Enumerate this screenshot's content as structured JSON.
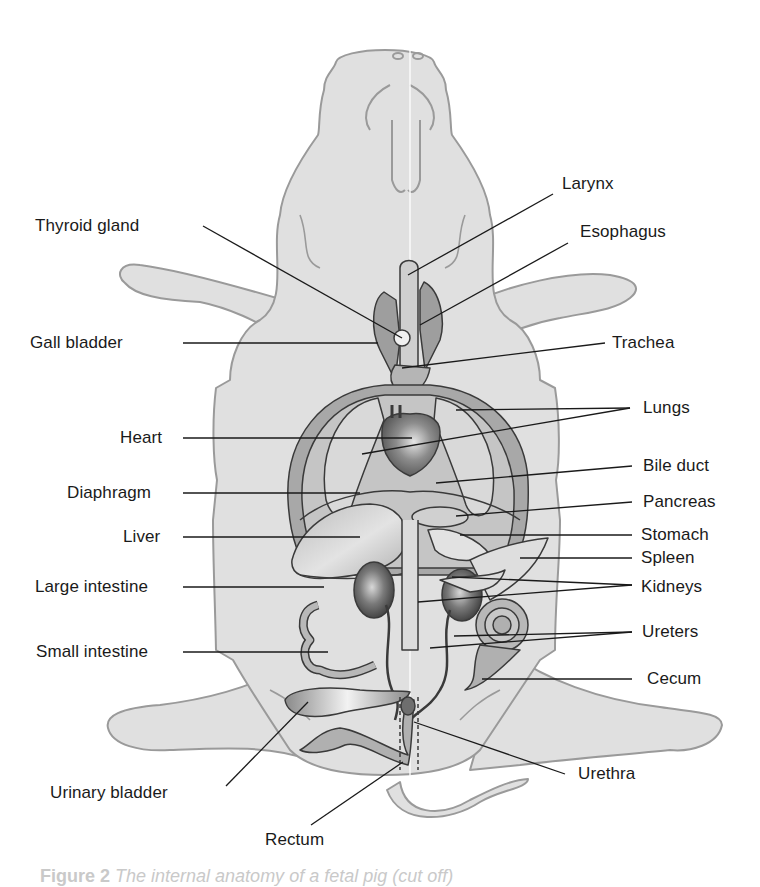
{
  "diagram": {
    "colors": {
      "background": "#ffffff",
      "body_fill": "#e0e0e0",
      "body_outline": "#9a9a9a",
      "organ_light": "#c8c8c8",
      "organ_mid": "#a8a8a8",
      "organ_dark": "#6e6e6e",
      "leader_line": "#1a1a1a",
      "label_text": "#1a1a1a"
    },
    "labels_left": [
      {
        "id": "thyroid-gland",
        "text": "Thyroid gland"
      },
      {
        "id": "gall-bladder",
        "text": "Gall bladder"
      },
      {
        "id": "heart",
        "text": "Heart"
      },
      {
        "id": "diaphragm",
        "text": "Diaphragm"
      },
      {
        "id": "liver",
        "text": "Liver"
      },
      {
        "id": "large-intestine",
        "text": "Large intestine"
      },
      {
        "id": "small-intestine",
        "text": "Small intestine"
      },
      {
        "id": "urinary-bladder",
        "text": "Urinary bladder"
      },
      {
        "id": "rectum",
        "text": "Rectum"
      }
    ],
    "labels_right": [
      {
        "id": "larynx",
        "text": "Larynx"
      },
      {
        "id": "esophagus",
        "text": "Esophagus"
      },
      {
        "id": "trachea",
        "text": "Trachea"
      },
      {
        "id": "lungs",
        "text": "Lungs"
      },
      {
        "id": "bile-duct",
        "text": "Bile duct"
      },
      {
        "id": "pancreas",
        "text": "Pancreas"
      },
      {
        "id": "stomach",
        "text": "Stomach"
      },
      {
        "id": "spleen",
        "text": "Spleen"
      },
      {
        "id": "kidneys",
        "text": "Kidneys"
      },
      {
        "id": "ureters",
        "text": "Ureters"
      },
      {
        "id": "cecum",
        "text": "Cecum"
      },
      {
        "id": "urethra",
        "text": "Urethra"
      }
    ],
    "caption": {
      "prefix": "Figure 2",
      "text": "The internal anatomy of a fetal pig (cut off)"
    }
  }
}
